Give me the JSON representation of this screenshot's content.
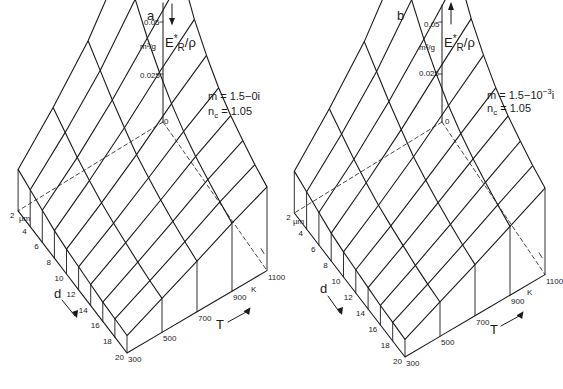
{
  "chart_data": [
    {
      "type": "surface-3d",
      "panel": "a",
      "title": "a",
      "zlabel": "E*_R / ρ",
      "zunit": "m²/g",
      "z_ticks": [
        "0.05",
        "0.025",
        "0"
      ],
      "zlim": [
        0,
        0.05
      ],
      "xlabel": "T",
      "xunit": "K",
      "x_ticks": [
        300,
        500,
        700,
        900,
        1100
      ],
      "ylabel": "d",
      "yunit": "µm",
      "y_ticks": [
        2,
        4,
        6,
        8,
        10,
        12,
        14,
        16,
        18,
        20
      ],
      "params": [
        "m = 1.5−0i",
        "n_c = 1.05"
      ],
      "note": "Surface values estimated from projected mesh heights; peak near d=2 µm, T=1100 K (~0.027 m²/g), decreasing with d and with decreasing T.",
      "z_estimate_rows_by_d": {
        "2": [
          0.0045,
          0.009,
          0.014,
          0.0205,
          0.0275
        ],
        "4": [
          0.004,
          0.008,
          0.0125,
          0.018,
          0.0235
        ],
        "6": [
          0.0035,
          0.007,
          0.011,
          0.0155,
          0.02
        ],
        "8": [
          0.003,
          0.0062,
          0.0097,
          0.0135,
          0.017
        ],
        "10": [
          0.0027,
          0.0055,
          0.0085,
          0.0118,
          0.0148
        ],
        "12": [
          0.0025,
          0.005,
          0.0077,
          0.0105,
          0.013
        ],
        "14": [
          0.0023,
          0.0046,
          0.007,
          0.0095,
          0.0117
        ],
        "16": [
          0.0021,
          0.0042,
          0.0064,
          0.0087,
          0.0107
        ],
        "18": [
          0.002,
          0.0039,
          0.0059,
          0.008,
          0.0098
        ],
        "20": [
          0.0019,
          0.0037,
          0.0055,
          0.0074,
          0.0091
        ]
      }
    },
    {
      "type": "surface-3d",
      "panel": "b",
      "title": "b",
      "zlabel": "E*_R / ρ",
      "zunit": "m²/g",
      "z_ticks": [
        "0.05",
        "0.025",
        "0"
      ],
      "zlim": [
        0,
        0.05
      ],
      "xlabel": "T",
      "xunit": "K",
      "x_ticks": [
        300,
        500,
        700,
        900,
        1100
      ],
      "ylabel": "d",
      "yunit": "µm",
      "y_ticks": [
        2,
        4,
        6,
        8,
        10,
        12,
        14,
        16,
        18,
        20
      ],
      "params": [
        "m = 1.5−10⁻³i",
        "n_c = 1.05"
      ],
      "note": "Nearly identical to panel a; slight absorption term.",
      "z_estimate_rows_by_d": {
        "2": [
          0.0045,
          0.009,
          0.014,
          0.0205,
          0.028
        ],
        "4": [
          0.004,
          0.008,
          0.0125,
          0.018,
          0.0238
        ],
        "6": [
          0.0035,
          0.007,
          0.011,
          0.0155,
          0.0202
        ],
        "8": [
          0.003,
          0.0062,
          0.0097,
          0.0135,
          0.0172
        ],
        "10": [
          0.0027,
          0.0055,
          0.0085,
          0.0118,
          0.015
        ],
        "12": [
          0.0025,
          0.005,
          0.0077,
          0.0105,
          0.0132
        ],
        "14": [
          0.0023,
          0.0046,
          0.007,
          0.0095,
          0.0119
        ],
        "16": [
          0.0021,
          0.0042,
          0.0064,
          0.0087,
          0.0109
        ],
        "18": [
          0.002,
          0.0039,
          0.0059,
          0.008,
          0.01
        ],
        "20": [
          0.0019,
          0.0037,
          0.0055,
          0.0074,
          0.0093
        ]
      }
    }
  ],
  "panels": [
    {
      "letter": "a",
      "z_tick_top": "0.05",
      "z_tick_mid": "0.025",
      "z_unit": "m²/g",
      "z_zero": "0",
      "z_label_main": "E",
      "z_label_sup": "*",
      "z_label_sub": "R",
      "z_label_tail": "/ρ",
      "param1": "m = 1.5−0i",
      "param2_main": "n",
      "param2_sub": "c",
      "param2_tail": " = 1.05",
      "d_label": "d",
      "d_unit": "µm",
      "T_label": "T",
      "T_unit": "K",
      "d_ticks": [
        "2",
        "4",
        "6",
        "8",
        "10",
        "12",
        "14",
        "16",
        "18",
        "20"
      ],
      "T_ticks": [
        "300",
        "500",
        "700",
        "900",
        "1100"
      ]
    },
    {
      "letter": "b",
      "z_tick_top": "0.05",
      "z_tick_mid": "0.025",
      "z_unit": "m²/g",
      "z_zero": "0",
      "z_label_main": "E",
      "z_label_sup": "*",
      "z_label_sub": "R",
      "z_label_tail": "/ρ",
      "param1_main": "m = 1.5−10",
      "param1_sup": "−3",
      "param1_tail": "i",
      "param2_main": "n",
      "param2_sub": "c",
      "param2_tail": " = 1.05",
      "d_label": "d",
      "d_unit": "µm",
      "T_label": "T",
      "T_unit": "K",
      "d_ticks": [
        "2",
        "4",
        "6",
        "8",
        "10",
        "12",
        "14",
        "16",
        "18",
        "20"
      ],
      "T_ticks": [
        "300",
        "500",
        "700",
        "900",
        "1100"
      ]
    }
  ],
  "colors": {
    "ink": "#1a1a1a",
    "background": "#ffffff"
  }
}
